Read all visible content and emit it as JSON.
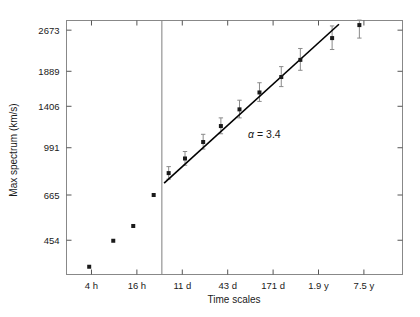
{
  "figure": {
    "background_color": "#ffffff",
    "axis_color": "#808080",
    "data_color": "#1a1a1a",
    "fit_line_color": "#000000",
    "errorbar_color": "#8a8a8a"
  },
  "chart_data": {
    "type": "scatter",
    "title": "",
    "xlabel": "Time scales",
    "ylabel": "Max spectrum (km/s)",
    "xscale": "log",
    "yscale": "log",
    "grid": false,
    "legend": null,
    "xtick_labels": [
      "4 h",
      "16 h",
      "11 d",
      "43 d",
      "171 d",
      "1.9 y",
      "7.5 y"
    ],
    "xtick_positions": [
      1,
      2,
      3,
      4,
      5,
      6,
      7
    ],
    "ytick_labels": [
      "454",
      "665",
      "991",
      "1406",
      "1889",
      "2673"
    ],
    "ytick_values": [
      454,
      665,
      991,
      1406,
      1889,
      2673
    ],
    "ylim": [
      340,
      2900
    ],
    "xlim": [
      0.45,
      7.85
    ],
    "annotations": [
      {
        "name": "slope-annotation",
        "symbol": "α",
        "equals": " = ",
        "value": "3.4",
        "x": 4.45,
        "y": 1080
      }
    ],
    "divider_line": {
      "name": "region-divider",
      "x": 2.55,
      "orientation": "vertical"
    },
    "series": [
      {
        "name": "short-timescale-points",
        "marker": "square",
        "has_errorbars": false,
        "has_fit": false,
        "points": [
          {
            "x": 0.95,
            "y": 363
          },
          {
            "x": 1.48,
            "y": 452
          },
          {
            "x": 1.92,
            "y": 512
          },
          {
            "x": 2.37,
            "y": 665
          }
        ]
      },
      {
        "name": "long-timescale-points",
        "marker": "square",
        "has_errorbars": true,
        "has_fit": true,
        "points": [
          {
            "x": 2.7,
            "y": 800,
            "yerr_lo": 40,
            "yerr_hi": 45
          },
          {
            "x": 3.06,
            "y": 905,
            "yerr_lo": 50,
            "yerr_hi": 55
          },
          {
            "x": 3.46,
            "y": 1040,
            "yerr_lo": 60,
            "yerr_hi": 70
          },
          {
            "x": 3.85,
            "y": 1190,
            "yerr_lo": 75,
            "yerr_hi": 85
          },
          {
            "x": 4.26,
            "y": 1370,
            "yerr_lo": 95,
            "yerr_hi": 110
          },
          {
            "x": 4.7,
            "y": 1580,
            "yerr_lo": 115,
            "yerr_hi": 135
          },
          {
            "x": 5.18,
            "y": 1800,
            "yerr_lo": 140,
            "yerr_hi": 165
          },
          {
            "x": 5.6,
            "y": 2080,
            "yerr_lo": 175,
            "yerr_hi": 210
          },
          {
            "x": 6.3,
            "y": 2500,
            "yerr_lo": 230,
            "yerr_hi": 270
          },
          {
            "x": 6.9,
            "y": 2790,
            "yerr_lo": 290,
            "yerr_hi": 120
          }
        ]
      }
    ],
    "fit_line": {
      "name": "power-law-fit",
      "slope_label": "α = 3.4",
      "x_start": 2.6,
      "y_start": 735,
      "x_end": 6.45,
      "y_end": 2810
    }
  }
}
